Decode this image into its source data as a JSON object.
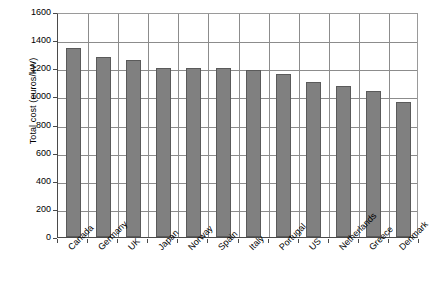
{
  "chart_data": {
    "type": "bar",
    "title": "",
    "xlabel": "",
    "ylabel": "Total cost (euros/kW)",
    "ylim": [
      0,
      1600
    ],
    "ytick_step": 200,
    "yticks": [
      0,
      200,
      400,
      600,
      800,
      1000,
      1200,
      1400,
      1600
    ],
    "grid": true,
    "legend": null,
    "bar_color": "#808080",
    "bar_border_color": "#5a5a5a",
    "categories": [
      "Canada",
      "Germany",
      "UK",
      "Japan",
      "Norway",
      "Spain",
      "Italy",
      "Portugal",
      "US",
      "Netherlands",
      "Greece",
      "Denmark"
    ],
    "values": [
      1345,
      1280,
      1258,
      1205,
      1205,
      1205,
      1190,
      1160,
      1103,
      1075,
      1035,
      958
    ]
  }
}
